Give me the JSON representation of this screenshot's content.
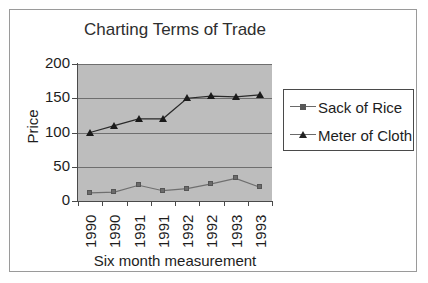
{
  "chart_data": {
    "type": "line",
    "title": "Charting Terms of Trade",
    "xlabel": "Six month measurement",
    "ylabel": "Price",
    "categories": [
      "1990",
      "1990",
      "1991",
      "1991",
      "1992",
      "1992",
      "1993",
      "1993"
    ],
    "ylim": [
      0,
      200
    ],
    "yticks": [
      0,
      50,
      100,
      150,
      200
    ],
    "ytick_labels": [
      "0",
      "50",
      "100",
      "150",
      "200"
    ],
    "grid": true,
    "legend_position": "right",
    "plot_background": "#bdbdbd",
    "series": [
      {
        "name": "Sack of Rice",
        "marker": "square",
        "color": "#6b6b6b",
        "values": [
          12,
          13,
          23,
          15,
          18,
          25,
          33,
          20
        ]
      },
      {
        "name": "Meter of Cloth",
        "marker": "triangle",
        "color": "#1a1a1a",
        "values": [
          100,
          110,
          120,
          120,
          150,
          153,
          152,
          155
        ]
      }
    ]
  },
  "legend": {
    "items": [
      {
        "label": "Sack of Rice",
        "marker": "square"
      },
      {
        "label": "Meter of Cloth",
        "marker": "triangle"
      }
    ]
  }
}
